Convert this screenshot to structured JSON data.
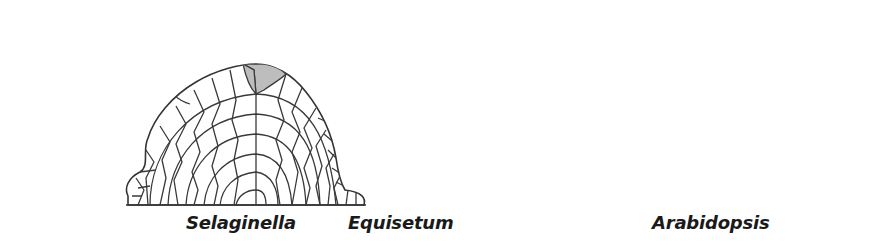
{
  "figure": {
    "panels": [
      {
        "id": "selaginella",
        "label": "Selaginella",
        "apical_cells_shaded": 2,
        "shade_color": "#bdbdbd"
      },
      {
        "id": "equisetum",
        "label": "Equisetum",
        "apical_cells_shaded": 1,
        "shade_color": "#bdbdbd"
      },
      {
        "id": "arabidopsis",
        "label": "Arabidopsis",
        "apical_cells_shaded": "central zone (multiple cells)",
        "shade_color": "#bdbdbd"
      }
    ],
    "line_color": "#333333",
    "background": "#ffffff"
  }
}
